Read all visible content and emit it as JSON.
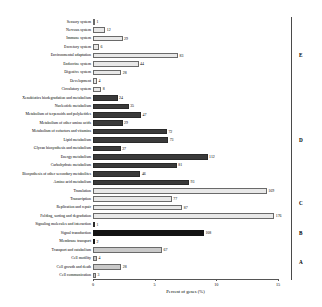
{
  "chart_data": {
    "type": "bar",
    "title": "",
    "xlabel": "Percent of genes (%)",
    "ylabel": "",
    "xlim": [
      0,
      15
    ],
    "xticks": [
      0,
      5,
      10,
      15
    ],
    "xtick_labels": [
      "0",
      "5",
      "10",
      "15"
    ],
    "grid": false,
    "orientation": "horizontal",
    "legend": "none",
    "total_genes": 1193,
    "categories": [
      "Sensory system",
      "Nervous system",
      "Immune system",
      "Excretory system",
      "Environmental adaptation",
      "Endocrine system",
      "Digestive system",
      "Development",
      "Circulatory system",
      "Xenobiotics biodegradation and metabolism",
      "Nucleotide metabolism",
      "Metabolism of terpenoids and polyketides",
      "Metabolism of other amino acids",
      "Metabolism of cofactors and vitamins",
      "Lipid metabolism",
      "Glycan biosynthesis and metabolism",
      "Energy metabolism",
      "Carbohydrate metabolism",
      "Biosynthesis of other secondary metabolites",
      "Amino acid metabolism",
      "Translation",
      "Transcription",
      "Replication and repair",
      "Folding, sorting and degradation",
      "Signaling molecules and interaction",
      "Signal transduction",
      "Membrane transport",
      "Transport and catabolism",
      "Cell motility",
      "Cell growth and death",
      "Cell communication"
    ],
    "values": [
      1,
      12,
      29,
      6,
      83,
      44,
      28,
      4,
      8,
      24,
      35,
      47,
      29,
      72,
      73,
      27,
      112,
      81,
      46,
      93,
      169,
      77,
      87,
      176,
      1,
      108,
      2,
      67,
      4,
      28,
      3
    ],
    "percents": [
      0.08,
      1.0,
      2.4,
      0.5,
      6.9,
      3.7,
      2.3,
      0.33,
      0.67,
      2.0,
      2.9,
      3.9,
      2.4,
      6.0,
      6.1,
      2.25,
      9.3,
      6.8,
      3.85,
      7.8,
      14.1,
      6.4,
      7.25,
      14.7,
      0.08,
      9.0,
      0.17,
      5.6,
      0.33,
      2.3,
      0.25
    ],
    "bar_styles": [
      "light",
      "light",
      "light",
      "light",
      "light",
      "light",
      "light",
      "light",
      "light",
      "dark",
      "dark",
      "dark",
      "dark",
      "dark",
      "dark",
      "dark",
      "dark",
      "dark",
      "dark",
      "dark",
      "light",
      "light",
      "light",
      "light",
      "dark",
      "black",
      "black",
      "mid",
      "mid",
      "mid",
      "mid"
    ],
    "groups": [
      {
        "letter": "E",
        "name": "Organismal Systems",
        "start_index": 0,
        "end_index": 8
      },
      {
        "letter": "D",
        "name": "Metabolism",
        "start_index": 9,
        "end_index": 19
      },
      {
        "letter": "C",
        "name": "Genetic Information Processing",
        "start_index": 20,
        "end_index": 23
      },
      {
        "letter": "B",
        "name": "Environmental Information Processing",
        "start_index": 24,
        "end_index": 26
      },
      {
        "letter": "A",
        "name": "Cellular Processes",
        "start_index": 27,
        "end_index": 30
      }
    ]
  },
  "axis": {
    "x_title": "Percent of genes (%)",
    "tick_labels": [
      "0",
      "5",
      "10",
      "15"
    ]
  },
  "group_labels": [
    "E",
    "D",
    "C",
    "B",
    "A"
  ]
}
